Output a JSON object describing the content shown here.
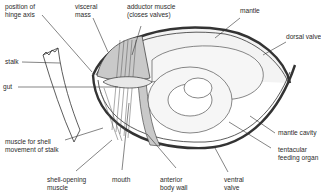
{
  "diagram": {
    "colors": {
      "line": "#333333",
      "fill_grey": "#c9c9c9",
      "fill_light": "#ececec",
      "background": "#ffffff"
    },
    "labels": {
      "hinge_axis": "position of\nhinge axis",
      "visceral_mass": "visceral\nmass",
      "adductor_muscle": "adductor muscle\n(closes valves)",
      "mantle": "mantle",
      "dorsal_valve": "dorsal valve",
      "stalk": "stalk",
      "gut": "gut",
      "muscle_stalk": "muscle for shell\nmovement of stalk",
      "shell_opening_muscle": "shell-opening\nmuscle",
      "mouth": "mouth",
      "anterior_body_wall": "anterior\nbody wall",
      "ventral_valve": "ventral\nvalve",
      "mantle_cavity": "mantle cavity",
      "tentacular_feeding_organ": "tentacular\nfeeding organ"
    }
  }
}
